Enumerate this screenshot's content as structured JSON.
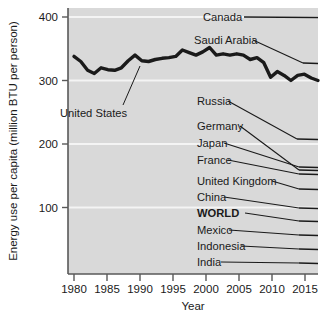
{
  "chart_data": {
    "type": "line",
    "title": "",
    "xlabel": "Year",
    "ylabel": "Energy use per capita (million BTU per person)",
    "xlim": [
      1979,
      2017
    ],
    "ylim": [
      0,
      420
    ],
    "xticks": [
      "1980",
      "1985",
      "1990",
      "1995",
      "2000",
      "2005",
      "2010",
      "2015"
    ],
    "xtick_values": [
      1980,
      1985,
      1990,
      1995,
      2000,
      2005,
      2010,
      2015
    ],
    "yticks": [
      "400",
      "300",
      "200",
      "100"
    ],
    "ytick_values": [
      400,
      300,
      200,
      100
    ],
    "grid": "horizontal-white",
    "plot_background": "#d9d9d9",
    "legend_position": "right-inline-labels",
    "series": [
      {
        "name": "Canada",
        "label": "Canada",
        "bold": false,
        "highlighted": false,
        "label_x": 203,
        "label_y": 21,
        "end_value": 400,
        "values": [
          400,
          400,
          400,
          400,
          400,
          400,
          400,
          400,
          400,
          400,
          400,
          400,
          400,
          400,
          400,
          400,
          400,
          400,
          400,
          400,
          400,
          400,
          400,
          400,
          400,
          400,
          400,
          400,
          400,
          400,
          400,
          400,
          400,
          400,
          400,
          400,
          400
        ]
      },
      {
        "name": "Saudi Arabia",
        "label": "Saudi Arabia",
        "bold": false,
        "highlighted": false,
        "label_x": 194,
        "label_y": 41,
        "end_value": 328,
        "values": [
          328
        ]
      },
      {
        "name": "United States",
        "label": "United States",
        "bold": false,
        "highlighted": true,
        "label_x": 60,
        "label_y": 113,
        "end_value": 300,
        "x": [
          1980,
          1981,
          1982,
          1983,
          1984,
          1985,
          1986,
          1987,
          1988,
          1989,
          1990,
          1991,
          1992,
          1993,
          1994,
          1995,
          1996,
          1997,
          1998,
          1999,
          2000,
          2001,
          2002,
          2003,
          2004,
          2005,
          2006,
          2007,
          2008,
          2009,
          2010,
          2011,
          2012,
          2013,
          2014,
          2015,
          2016
        ],
        "values": [
          338,
          330,
          316,
          311,
          320,
          317,
          316,
          320,
          331,
          340,
          331,
          330,
          333,
          335,
          336,
          338,
          348,
          344,
          340,
          345,
          352,
          340,
          342,
          340,
          342,
          340,
          333,
          336,
          328,
          305,
          314,
          308,
          300,
          308,
          310,
          304,
          300
        ]
      },
      {
        "name": "Russia",
        "label": "Russia",
        "bold": false,
        "highlighted": false,
        "label_x": 197,
        "label_y": 104,
        "end_value": 210,
        "values": [
          210
        ]
      },
      {
        "name": "Germany",
        "label": "Germany",
        "bold": false,
        "highlighted": false,
        "label_x": 197,
        "label_y": 128,
        "end_value": 152,
        "values": [
          152
        ]
      },
      {
        "name": "Japan",
        "label": "Japan",
        "bold": false,
        "highlighted": false,
        "label_x": 197,
        "label_y": 145,
        "end_value": 155,
        "values": [
          155
        ]
      },
      {
        "name": "France",
        "label": "France",
        "bold": false,
        "highlighted": false,
        "label_x": 197,
        "label_y": 162,
        "end_value": 148,
        "values": [
          148
        ]
      },
      {
        "name": "United Kingdom",
        "label": "United Kingdom",
        "bold": false,
        "highlighted": false,
        "label_x": 197,
        "label_y": 184,
        "end_value": 124,
        "values": [
          124
        ]
      },
      {
        "name": "China",
        "label": "China",
        "bold": false,
        "highlighted": false,
        "label_x": 197,
        "label_y": 200,
        "end_value": 95,
        "values": [
          95
        ]
      },
      {
        "name": "WORLD",
        "label": "WORLD",
        "bold": true,
        "highlighted": false,
        "label_x": 197,
        "label_y": 216,
        "end_value": 75,
        "values": [
          75
        ]
      },
      {
        "name": "Mexico",
        "label": "Mexico",
        "bold": false,
        "highlighted": false,
        "label_x": 197,
        "label_y": 233,
        "end_value": 65,
        "values": [
          65
        ]
      },
      {
        "name": "Indonesia",
        "label": "Indonesia",
        "bold": false,
        "highlighted": false,
        "label_x": 197,
        "label_y": 249,
        "end_value": 38,
        "values": [
          38
        ]
      },
      {
        "name": "India",
        "label": "India",
        "bold": false,
        "highlighted": false,
        "label_x": 197,
        "label_y": 265,
        "end_value": 25,
        "values": [
          25
        ]
      }
    ],
    "annotations": [
      {
        "text": "United States",
        "x": 60,
        "y": 113
      }
    ]
  },
  "axes": {
    "y_title": "Energy use per capita (million BTU per person)",
    "x_title": "Year",
    "ytick_0": "400",
    "ytick_1": "300",
    "ytick_2": "200",
    "ytick_3": "100",
    "xtick_0": "1980",
    "xtick_1": "1985",
    "xtick_2": "1990",
    "xtick_3": "1995",
    "xtick_4": "2000",
    "xtick_5": "2005",
    "xtick_6": "2010",
    "xtick_7": "2015"
  },
  "labels": {
    "canada": "Canada",
    "saudi_arabia": "Saudi Arabia",
    "united_states": "United States",
    "russia": "Russia",
    "germany": "Germany",
    "japan": "Japan",
    "france": "France",
    "united_kingdom": "United Kingdom",
    "china": "China",
    "world": "WORLD",
    "mexico": "Mexico",
    "indonesia": "Indonesia",
    "india": "India"
  },
  "colors": {
    "plot_bg": "#d9d9d9",
    "grid": "#f2f2f2",
    "axis": "#595959",
    "line": "#1a1a1a",
    "text": "#1a1a1a",
    "page_bg": "#ffffff"
  }
}
